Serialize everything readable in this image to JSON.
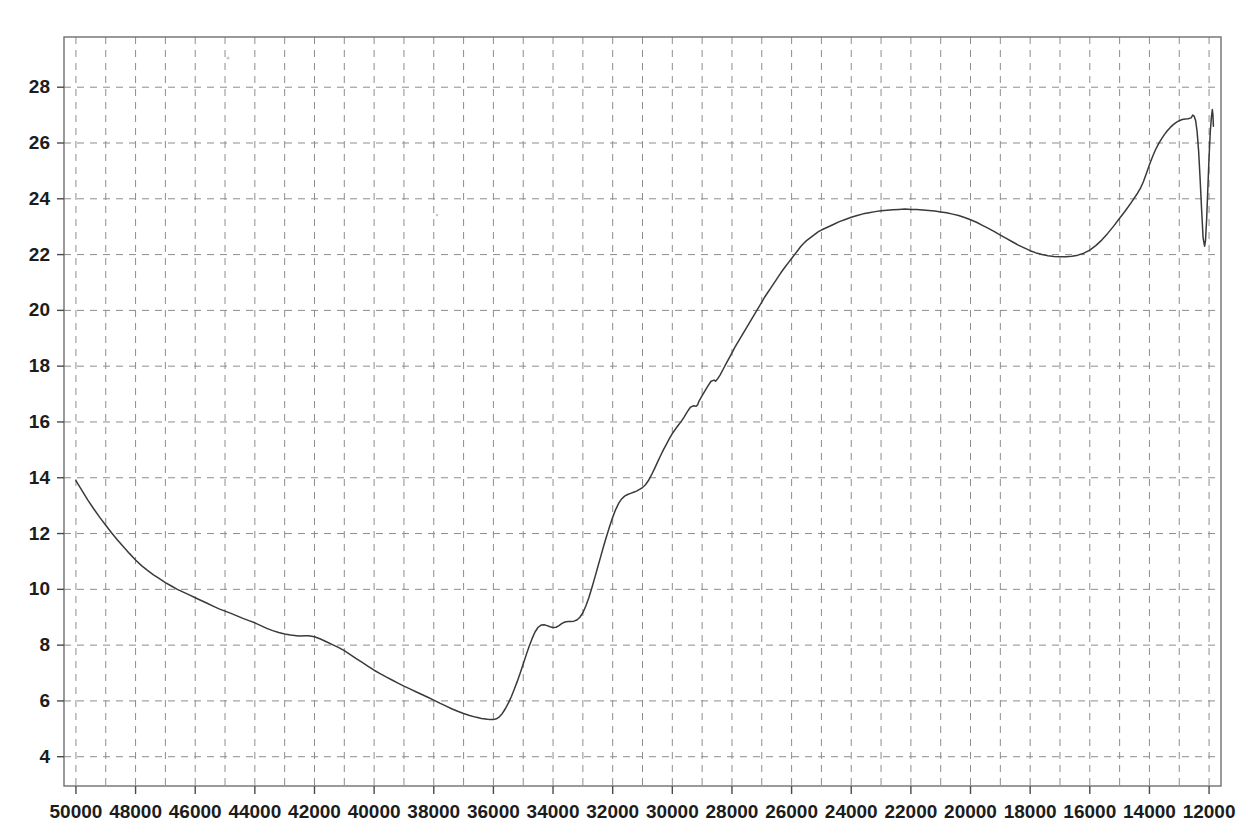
{
  "chart_data": {
    "type": "line",
    "title": "",
    "subtitle": "",
    "xlabel": "",
    "ylabel": "",
    "grid": true,
    "legend": null,
    "x_axis_reversed": true,
    "xlim": [
      50400,
      11600
    ],
    "ylim": [
      2.95,
      29.8
    ],
    "x_ticks": [
      50000,
      48000,
      46000,
      44000,
      42000,
      40000,
      38000,
      36000,
      34000,
      32000,
      30000,
      28000,
      26000,
      24000,
      22000,
      20000,
      18000,
      16000,
      14000,
      12000
    ],
    "x_tick_labels": [
      "50000",
      "48000",
      "46000",
      "44000",
      "42000",
      "40000",
      "38000",
      "36000",
      "34000",
      "32000",
      "30000",
      "28000",
      "26000",
      "24000",
      "22000",
      "20000",
      "18000",
      "16000",
      "14000",
      "12000"
    ],
    "y_ticks": [
      4,
      6,
      8,
      10,
      12,
      14,
      16,
      18,
      20,
      22,
      24,
      26,
      28
    ],
    "y_tick_labels": [
      "4",
      "6",
      "8",
      "10",
      "12",
      "14",
      "16",
      "18",
      "20",
      "22",
      "24",
      "26",
      "28"
    ],
    "y_minor_gridlines": [
      5,
      7,
      9,
      11,
      13,
      15,
      17,
      19,
      21,
      23,
      25,
      27,
      29
    ],
    "x_minor_gridlines": [
      49000,
      47000,
      45000,
      43000,
      41000,
      39000,
      37000,
      35000,
      33000,
      31000,
      29000,
      27000,
      25000,
      23000,
      21000,
      19000,
      17000,
      15000,
      13000
    ],
    "series": [
      {
        "name": "spectrum",
        "color": "#3a3a3a",
        "points": [
          [
            50000,
            13.9
          ],
          [
            49800,
            13.55
          ],
          [
            49600,
            13.2
          ],
          [
            49400,
            12.88
          ],
          [
            49200,
            12.58
          ],
          [
            49000,
            12.3
          ],
          [
            48800,
            12.02
          ],
          [
            48600,
            11.76
          ],
          [
            48400,
            11.52
          ],
          [
            48200,
            11.28
          ],
          [
            48000,
            11.05
          ],
          [
            47800,
            10.85
          ],
          [
            47600,
            10.68
          ],
          [
            47400,
            10.52
          ],
          [
            47200,
            10.38
          ],
          [
            47000,
            10.24
          ],
          [
            46800,
            10.12
          ],
          [
            46600,
            10.0
          ],
          [
            46400,
            9.9
          ],
          [
            46200,
            9.8
          ],
          [
            46000,
            9.7
          ],
          [
            45800,
            9.6
          ],
          [
            45600,
            9.5
          ],
          [
            45400,
            9.4
          ],
          [
            45200,
            9.3
          ],
          [
            45000,
            9.22
          ],
          [
            44800,
            9.14
          ],
          [
            44600,
            9.05
          ],
          [
            44400,
            8.96
          ],
          [
            44200,
            8.88
          ],
          [
            44000,
            8.8
          ],
          [
            43800,
            8.7
          ],
          [
            43600,
            8.6
          ],
          [
            43400,
            8.52
          ],
          [
            43200,
            8.45
          ],
          [
            43000,
            8.4
          ],
          [
            42800,
            8.36
          ],
          [
            42600,
            8.34
          ],
          [
            42500,
            8.33
          ],
          [
            42300,
            8.34
          ],
          [
            42200,
            8.34
          ],
          [
            42000,
            8.3
          ],
          [
            41800,
            8.22
          ],
          [
            41600,
            8.12
          ],
          [
            41400,
            8.02
          ],
          [
            41200,
            7.92
          ],
          [
            41000,
            7.8
          ],
          [
            40800,
            7.66
          ],
          [
            40600,
            7.52
          ],
          [
            40400,
            7.38
          ],
          [
            40200,
            7.24
          ],
          [
            40000,
            7.1
          ],
          [
            39800,
            6.98
          ],
          [
            39600,
            6.86
          ],
          [
            39400,
            6.75
          ],
          [
            39200,
            6.64
          ],
          [
            39000,
            6.53
          ],
          [
            38800,
            6.43
          ],
          [
            38600,
            6.33
          ],
          [
            38400,
            6.23
          ],
          [
            38200,
            6.13
          ],
          [
            38000,
            6.03
          ],
          [
            37800,
            5.92
          ],
          [
            37600,
            5.82
          ],
          [
            37400,
            5.72
          ],
          [
            37200,
            5.63
          ],
          [
            37000,
            5.55
          ],
          [
            36800,
            5.48
          ],
          [
            36600,
            5.42
          ],
          [
            36400,
            5.37
          ],
          [
            36200,
            5.34
          ],
          [
            36100,
            5.33
          ],
          [
            36000,
            5.33
          ],
          [
            35900,
            5.36
          ],
          [
            35800,
            5.43
          ],
          [
            35700,
            5.55
          ],
          [
            35600,
            5.72
          ],
          [
            35500,
            5.92
          ],
          [
            35400,
            6.15
          ],
          [
            35300,
            6.42
          ],
          [
            35200,
            6.7
          ],
          [
            35100,
            7.0
          ],
          [
            35000,
            7.32
          ],
          [
            34900,
            7.65
          ],
          [
            34800,
            7.96
          ],
          [
            34700,
            8.24
          ],
          [
            34600,
            8.48
          ],
          [
            34500,
            8.64
          ],
          [
            34400,
            8.72
          ],
          [
            34300,
            8.73
          ],
          [
            34200,
            8.7
          ],
          [
            34100,
            8.66
          ],
          [
            34000,
            8.63
          ],
          [
            33900,
            8.64
          ],
          [
            33800,
            8.7
          ],
          [
            33700,
            8.78
          ],
          [
            33600,
            8.83
          ],
          [
            33500,
            8.85
          ],
          [
            33400,
            8.85
          ],
          [
            33300,
            8.86
          ],
          [
            33200,
            8.9
          ],
          [
            33100,
            9.0
          ],
          [
            33000,
            9.16
          ],
          [
            32900,
            9.4
          ],
          [
            32800,
            9.7
          ],
          [
            32700,
            10.05
          ],
          [
            32600,
            10.42
          ],
          [
            32500,
            10.8
          ],
          [
            32400,
            11.18
          ],
          [
            32300,
            11.56
          ],
          [
            32200,
            11.92
          ],
          [
            32100,
            12.26
          ],
          [
            32000,
            12.58
          ],
          [
            31900,
            12.86
          ],
          [
            31800,
            13.08
          ],
          [
            31700,
            13.24
          ],
          [
            31600,
            13.34
          ],
          [
            31500,
            13.4
          ],
          [
            31400,
            13.44
          ],
          [
            31300,
            13.48
          ],
          [
            31200,
            13.52
          ],
          [
            31100,
            13.58
          ],
          [
            31000,
            13.65
          ],
          [
            30900,
            13.75
          ],
          [
            30800,
            13.9
          ],
          [
            30700,
            14.1
          ],
          [
            30600,
            14.32
          ],
          [
            30500,
            14.55
          ],
          [
            30400,
            14.78
          ],
          [
            30300,
            15.0
          ],
          [
            30200,
            15.2
          ],
          [
            30100,
            15.4
          ],
          [
            30000,
            15.58
          ],
          [
            29900,
            15.74
          ],
          [
            29800,
            15.88
          ],
          [
            29700,
            16.02
          ],
          [
            29600,
            16.18
          ],
          [
            29500,
            16.36
          ],
          [
            29400,
            16.52
          ],
          [
            29300,
            16.58
          ],
          [
            29200,
            16.56
          ],
          [
            29150,
            16.62
          ],
          [
            29100,
            16.76
          ],
          [
            29000,
            16.94
          ],
          [
            28900,
            17.12
          ],
          [
            28800,
            17.3
          ],
          [
            28700,
            17.46
          ],
          [
            28600,
            17.5
          ],
          [
            28550,
            17.46
          ],
          [
            28500,
            17.52
          ],
          [
            28400,
            17.68
          ],
          [
            28300,
            17.88
          ],
          [
            28200,
            18.08
          ],
          [
            28100,
            18.28
          ],
          [
            28000,
            18.48
          ],
          [
            27900,
            18.68
          ],
          [
            27800,
            18.86
          ],
          [
            27700,
            19.04
          ],
          [
            27600,
            19.22
          ],
          [
            27500,
            19.4
          ],
          [
            27400,
            19.58
          ],
          [
            27300,
            19.76
          ],
          [
            27200,
            19.94
          ],
          [
            27100,
            20.12
          ],
          [
            27000,
            20.3
          ],
          [
            26900,
            20.48
          ],
          [
            26800,
            20.64
          ],
          [
            26700,
            20.8
          ],
          [
            26600,
            20.96
          ],
          [
            26500,
            21.12
          ],
          [
            26400,
            21.28
          ],
          [
            26300,
            21.44
          ],
          [
            26200,
            21.58
          ],
          [
            26100,
            21.72
          ],
          [
            26000,
            21.86
          ],
          [
            25900,
            22.0
          ],
          [
            25800,
            22.14
          ],
          [
            25700,
            22.28
          ],
          [
            25600,
            22.4
          ],
          [
            25500,
            22.5
          ],
          [
            25400,
            22.58
          ],
          [
            25300,
            22.66
          ],
          [
            25200,
            22.74
          ],
          [
            25100,
            22.82
          ],
          [
            25000,
            22.88
          ],
          [
            24800,
            22.98
          ],
          [
            24600,
            23.08
          ],
          [
            24400,
            23.18
          ],
          [
            24200,
            23.26
          ],
          [
            24000,
            23.34
          ],
          [
            23800,
            23.4
          ],
          [
            23600,
            23.46
          ],
          [
            23400,
            23.5
          ],
          [
            23200,
            23.54
          ],
          [
            23000,
            23.57
          ],
          [
            22800,
            23.59
          ],
          [
            22600,
            23.61
          ],
          [
            22400,
            23.62
          ],
          [
            22200,
            23.63
          ],
          [
            22000,
            23.62
          ],
          [
            21800,
            23.62
          ],
          [
            21600,
            23.6
          ],
          [
            21400,
            23.58
          ],
          [
            21200,
            23.56
          ],
          [
            21000,
            23.53
          ],
          [
            20800,
            23.5
          ],
          [
            20600,
            23.45
          ],
          [
            20400,
            23.4
          ],
          [
            20200,
            23.33
          ],
          [
            20000,
            23.25
          ],
          [
            19800,
            23.16
          ],
          [
            19600,
            23.05
          ],
          [
            19400,
            22.94
          ],
          [
            19200,
            22.82
          ],
          [
            19000,
            22.7
          ],
          [
            18800,
            22.58
          ],
          [
            18600,
            22.46
          ],
          [
            18400,
            22.34
          ],
          [
            18200,
            22.24
          ],
          [
            18000,
            22.14
          ],
          [
            17800,
            22.06
          ],
          [
            17600,
            22.0
          ],
          [
            17400,
            21.96
          ],
          [
            17200,
            21.93
          ],
          [
            17000,
            21.92
          ],
          [
            16800,
            21.92
          ],
          [
            16600,
            21.94
          ],
          [
            16400,
            21.98
          ],
          [
            16200,
            22.05
          ],
          [
            16000,
            22.16
          ],
          [
            15800,
            22.32
          ],
          [
            15600,
            22.52
          ],
          [
            15400,
            22.76
          ],
          [
            15200,
            23.02
          ],
          [
            15000,
            23.3
          ],
          [
            14800,
            23.58
          ],
          [
            14600,
            23.88
          ],
          [
            14400,
            24.2
          ],
          [
            14300,
            24.38
          ],
          [
            14200,
            24.62
          ],
          [
            14100,
            24.92
          ],
          [
            14000,
            25.22
          ],
          [
            13900,
            25.5
          ],
          [
            13800,
            25.75
          ],
          [
            13700,
            25.96
          ],
          [
            13600,
            26.14
          ],
          [
            13500,
            26.3
          ],
          [
            13400,
            26.44
          ],
          [
            13300,
            26.56
          ],
          [
            13200,
            26.66
          ],
          [
            13100,
            26.74
          ],
          [
            13000,
            26.8
          ],
          [
            12900,
            26.84
          ],
          [
            12800,
            26.86
          ],
          [
            12700,
            26.87
          ],
          [
            12600,
            26.9
          ],
          [
            12550,
            27.0
          ],
          [
            12500,
            26.96
          ],
          [
            12450,
            26.8
          ],
          [
            12400,
            26.4
          ],
          [
            12350,
            25.7
          ],
          [
            12300,
            24.7
          ],
          [
            12250,
            23.6
          ],
          [
            12200,
            22.6
          ],
          [
            12150,
            22.3
          ],
          [
            12120,
            22.5
          ],
          [
            12080,
            23.3
          ],
          [
            12040,
            24.4
          ],
          [
            12000,
            25.5
          ],
          [
            11960,
            26.4
          ],
          [
            11920,
            26.95
          ],
          [
            11890,
            27.2
          ],
          [
            11870,
            27.0
          ],
          [
            11855,
            26.6
          ]
        ]
      }
    ],
    "annotations": []
  },
  "colors": {
    "background": "#ffffff",
    "grid": "#8d8d8d",
    "axis": "#6f6f6f",
    "line": "#3a3a3a",
    "text": "#1c1c1c"
  }
}
